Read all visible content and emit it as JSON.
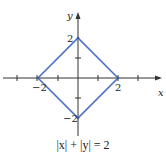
{
  "diagram": {
    "x_axis_label": "x",
    "y_axis_label": "y",
    "tick_labels": {
      "x_neg": "−2",
      "x_pos": "2",
      "y_pos": "2",
      "y_neg": "−2"
    },
    "caption": "|x| + |y| = 2",
    "shape": "diamond",
    "vertices": [
      [
        2,
        0
      ],
      [
        0,
        2
      ],
      [
        -2,
        0
      ],
      [
        0,
        -2
      ]
    ],
    "colors": {
      "shape": "#4a72c4",
      "axes": "#333333"
    }
  }
}
